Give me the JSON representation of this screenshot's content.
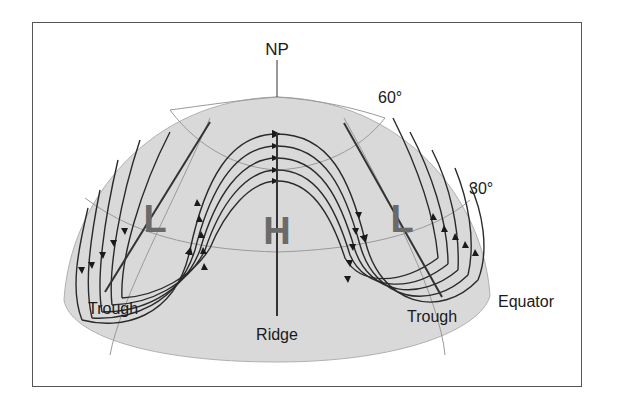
{
  "diagram": {
    "labels": {
      "pole": "NP",
      "lat60": "60°",
      "lat30": "30°",
      "equator": "Equator",
      "trough_left": "Trough",
      "trough_right": "Trough",
      "ridge": "Ridge",
      "low_left": "L",
      "high": "H",
      "low_right": "L"
    },
    "colors": {
      "dome": "#d9d9d9",
      "grid": "#9a9a9a",
      "streamline": "#2a2a2a",
      "pressure_letter": "#6a6a6a",
      "frame": "#555555"
    }
  }
}
